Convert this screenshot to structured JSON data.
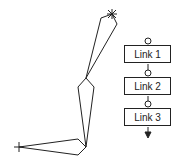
{
  "diagram": {
    "title": "",
    "chain": {
      "links": [
        {
          "label": "Link 1"
        },
        {
          "label": "Link 2"
        },
        {
          "label": "Link 3"
        }
      ],
      "joint_symbol": "circle",
      "end_symbol": "arrow-down"
    },
    "linkage": {
      "base_marker": "cross",
      "end_effector_marker": "star",
      "segments": 3
    },
    "colors": {
      "stroke": "#222222",
      "background": "#ffffff"
    }
  }
}
